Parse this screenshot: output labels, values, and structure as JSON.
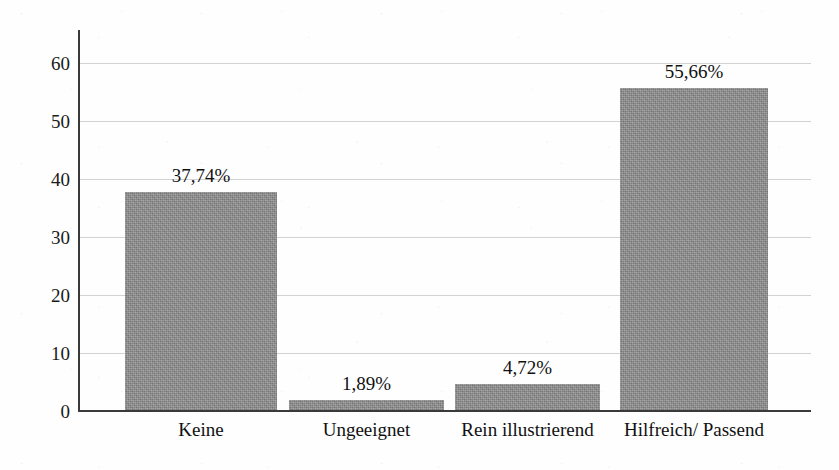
{
  "chart_data": {
    "type": "bar",
    "title": "",
    "xlabel": "",
    "ylabel": "Anteil in Prozent",
    "categories": [
      "Keine",
      "Ungeeignet",
      "Rein illustrierend",
      "Hilfreich/ Passend"
    ],
    "values": [
      37.74,
      1.89,
      4.72,
      55.66
    ],
    "data_labels": [
      "37,74%",
      "1,89%",
      "4,72%",
      "55,66%"
    ],
    "ylim": [
      0,
      60
    ],
    "yticks": [
      0,
      10,
      20,
      30,
      40,
      50,
      60
    ],
    "ytick_labels": [
      "0",
      "10",
      "20",
      "30",
      "40",
      "50",
      "60"
    ],
    "grid": "horizontal",
    "legend": "none",
    "bar_color": "#8b8b8b",
    "gridline_color": "#d2d2d2",
    "axis_color": "#3a3a3a",
    "background_color": "#ffffff",
    "decimal_separator": ","
  }
}
